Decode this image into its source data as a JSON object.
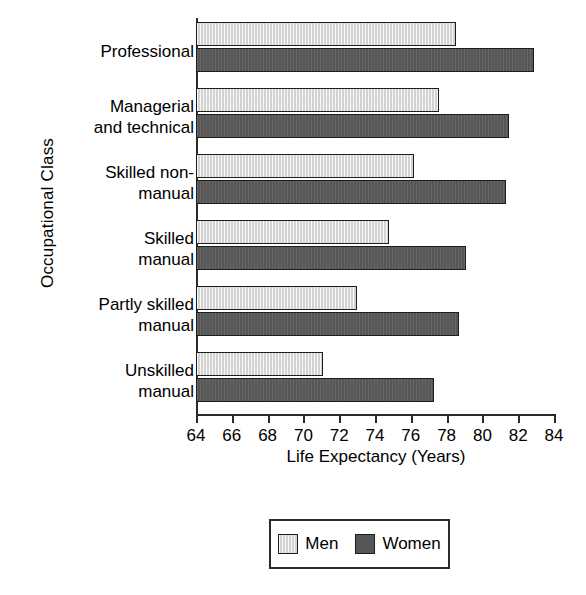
{
  "chart_data": {
    "type": "bar",
    "orientation": "horizontal",
    "title": "",
    "xlabel": "Life Expectancy (Years)",
    "ylabel": "Occupational Class",
    "xlim": [
      64,
      84
    ],
    "xticks": [
      64,
      66,
      68,
      70,
      72,
      74,
      76,
      78,
      80,
      82,
      84
    ],
    "grid": false,
    "legend_position": "bottom",
    "categories": [
      "Professional",
      "Managerial and technical",
      "Skilled non-manual",
      "Skilled manual",
      "Partly skilled manual",
      "Unskilled manual"
    ],
    "category_label_lines": [
      [
        "Professional"
      ],
      [
        "Managerial",
        "and technical"
      ],
      [
        "Skilled non-",
        "manual"
      ],
      [
        "Skilled",
        "manual"
      ],
      [
        "Partly skilled",
        "manual"
      ],
      [
        "Unskilled",
        "manual"
      ]
    ],
    "series": [
      {
        "name": "Men",
        "color": "#d2d2d2",
        "values": [
          78.5,
          77.6,
          76.2,
          74.8,
          73.0,
          71.1
        ]
      },
      {
        "name": "Women",
        "color": "#565656",
        "values": [
          82.9,
          81.5,
          81.3,
          79.1,
          78.7,
          77.3
        ]
      }
    ]
  },
  "legend": {
    "entries": [
      {
        "label": "Men",
        "swatch": "men"
      },
      {
        "label": "Women",
        "swatch": "women"
      }
    ]
  },
  "caption_fragment": ""
}
